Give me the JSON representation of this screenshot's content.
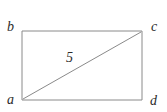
{
  "figure": {
    "type": "geometry-diagram",
    "shape": "rectangle-with-diagonal",
    "background_color": "#ffffff",
    "stroke_color": "#8a8a8a",
    "label_color": "#2b2b2b",
    "vertices": [
      {
        "id": "b",
        "label": "b",
        "position": "top-left"
      },
      {
        "id": "c",
        "label": "c",
        "position": "top-right"
      },
      {
        "id": "a",
        "label": "a",
        "position": "bottom-left"
      },
      {
        "id": "d",
        "label": "d",
        "position": "bottom-right"
      }
    ],
    "segments": [
      {
        "id": "side-top",
        "from": "b",
        "to": "c"
      },
      {
        "id": "side-right",
        "from": "c",
        "to": "d"
      },
      {
        "id": "side-bottom",
        "from": "d",
        "to": "a"
      },
      {
        "id": "side-left",
        "from": "a",
        "to": "b"
      },
      {
        "id": "diagonal-ac",
        "from": "a",
        "to": "c",
        "label": "5"
      }
    ],
    "diagonal_label": "5"
  }
}
